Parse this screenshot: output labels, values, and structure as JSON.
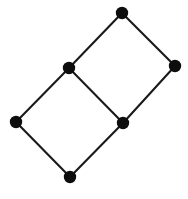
{
  "figure": {
    "width": 188,
    "height": 199,
    "background_color": "#ffffff",
    "node_color": "#0d0d0d",
    "edge_color": "#1a1a1a",
    "node_radius": 6.2,
    "edge_width": 2.1
  },
  "graph_data": {
    "type": "graph",
    "layout": "straight-line embedding",
    "directed": false,
    "node_count": 6,
    "edge_count": 7,
    "nodes": [
      {
        "id": "n1",
        "label": "",
        "x": 122,
        "y": 13,
        "name": "node-top"
      },
      {
        "id": "n2",
        "label": "",
        "x": 175,
        "y": 66,
        "name": "node-right"
      },
      {
        "id": "n3",
        "label": "",
        "x": 69,
        "y": 68,
        "name": "node-upper-left"
      },
      {
        "id": "n4",
        "label": "",
        "x": 123,
        "y": 123,
        "name": "node-center"
      },
      {
        "id": "n5",
        "label": "",
        "x": 16,
        "y": 122,
        "name": "node-left"
      },
      {
        "id": "n6",
        "label": "",
        "x": 70,
        "y": 177,
        "name": "node-bottom"
      }
    ],
    "edges": [
      {
        "id": "e1",
        "source": "n1",
        "target": "n3",
        "name": "edge-top-to-upper-left"
      },
      {
        "id": "e2",
        "source": "n1",
        "target": "n2",
        "name": "edge-top-to-right"
      },
      {
        "id": "e3",
        "source": "n2",
        "target": "n4",
        "name": "edge-right-to-center"
      },
      {
        "id": "e4",
        "source": "n3",
        "target": "n4",
        "name": "edge-upper-left-to-center"
      },
      {
        "id": "e5",
        "source": "n3",
        "target": "n5",
        "name": "edge-upper-left-to-left"
      },
      {
        "id": "e6",
        "source": "n5",
        "target": "n6",
        "name": "edge-left-to-bottom"
      },
      {
        "id": "e7",
        "source": "n6",
        "target": "n4",
        "name": "edge-bottom-to-center"
      }
    ]
  }
}
